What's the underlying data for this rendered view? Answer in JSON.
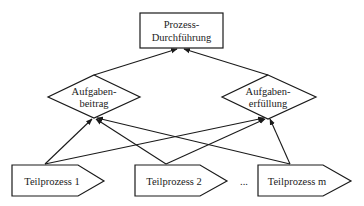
{
  "diagram": {
    "top_node": {
      "line1": "Prozess-",
      "line2": "Durchführung"
    },
    "middle_nodes": [
      {
        "line1": "Aufgaben-",
        "line2": "beitrag"
      },
      {
        "line1": "Aufgaben-",
        "line2": "erfüllung"
      }
    ],
    "bottom_nodes": [
      {
        "label": "Teilprozess 1"
      },
      {
        "label": "Teilprozess 2"
      },
      {
        "label": "Teilprozess m"
      }
    ],
    "ellipsis": "...",
    "colors": {
      "line": "#1a1a1a",
      "fill": "#ffffff",
      "text": "#222222"
    },
    "edges": [
      {
        "from": "Aufgabenbeitrag",
        "to": "Prozess-Durchführung"
      },
      {
        "from": "Aufgabenerfüllung",
        "to": "Prozess-Durchführung"
      },
      {
        "from": "Teilprozess 1",
        "to": "Aufgabenbeitrag"
      },
      {
        "from": "Teilprozess 1",
        "to": "Aufgabenerfüllung"
      },
      {
        "from": "Teilprozess 2",
        "to": "Aufgabenbeitrag"
      },
      {
        "from": "Teilprozess 2",
        "to": "Aufgabenerfüllung"
      },
      {
        "from": "Teilprozess m",
        "to": "Aufgabenbeitrag"
      },
      {
        "from": "Teilprozess m",
        "to": "Aufgabenerfüllung"
      }
    ]
  }
}
